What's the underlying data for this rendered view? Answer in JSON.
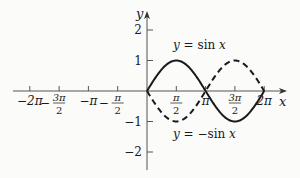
{
  "chart_data": {
    "type": "line",
    "title": "",
    "xlabel": "x",
    "ylabel": "y",
    "xlim": [
      -6.8,
      7.0
    ],
    "ylim": [
      -2.6,
      2.9
    ],
    "grid": false,
    "legend_position": "inline annotations",
    "x_ticks": [
      {
        "value": -6.2832,
        "label": "−2π"
      },
      {
        "value": -4.7124,
        "label": "3π/2",
        "sign": "−"
      },
      {
        "value": -3.1416,
        "label": "−π"
      },
      {
        "value": -1.5708,
        "label": "π/2",
        "sign": "−"
      },
      {
        "value": 1.5708,
        "label": "π/2"
      },
      {
        "value": 3.1416,
        "label": "π"
      },
      {
        "value": 4.7124,
        "label": "3π/2"
      },
      {
        "value": 6.2832,
        "label": "2π"
      }
    ],
    "y_ticks": [
      {
        "value": 2,
        "label": "2"
      },
      {
        "value": 1,
        "label": "1"
      },
      {
        "value": -1,
        "label": "−1"
      },
      {
        "value": -2,
        "label": "−2"
      }
    ],
    "x": [
      0,
      0.7854,
      1.5708,
      2.3562,
      3.1416,
      3.927,
      4.7124,
      5.4978,
      6.2832
    ],
    "series": [
      {
        "name": "y = sin x",
        "style": "solid",
        "values": [
          0,
          0.707,
          1,
          0.707,
          0,
          -0.707,
          -1,
          -0.707,
          0
        ]
      },
      {
        "name": "y = −sin x",
        "style": "dashed",
        "values": [
          0,
          -0.707,
          -1,
          -0.707,
          0,
          0.707,
          1,
          0.707,
          0
        ]
      }
    ],
    "annotations": [
      {
        "text_prefix": "y",
        "text_eq": " = ",
        "text_fn": "sin ",
        "text_var": "x",
        "for": "y = sin x"
      },
      {
        "text_prefix": "y",
        "text_eq": " = −",
        "text_fn": "sin ",
        "text_var": "x",
        "for": "y = −sin x"
      }
    ]
  },
  "axes": {
    "x_label": "x",
    "y_label": "y"
  },
  "colors": {
    "curve": "#1a1a1a",
    "axis": "#555555",
    "background": "#fbfbfa"
  }
}
